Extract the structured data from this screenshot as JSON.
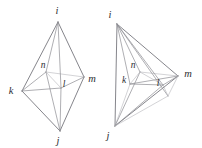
{
  "figure": {
    "kind": "geometry-line-drawing",
    "ink_color": "#8d8d92",
    "label_color": "#2d2d31",
    "background_color": "#ffffff",
    "panels": [
      {
        "id": "left",
        "name": "left-tetrahedron",
        "view": "front",
        "vertices": [
          {
            "label": "i",
            "x": 58,
            "y": 22,
            "label_x": 57,
            "label_y": 14
          },
          {
            "label": "j",
            "x": 60,
            "y": 131,
            "label_x": 58,
            "label_y": 144
          },
          {
            "label": "k",
            "x": 22,
            "y": 91,
            "label_x": 11,
            "label_y": 94
          },
          {
            "label": "m",
            "x": 84,
            "y": 77,
            "label_x": 90,
            "label_y": 82
          },
          {
            "label": "n",
            "x": 46,
            "y": 72,
            "label_x": 43,
            "label_y": 68
          },
          {
            "label": "l",
            "x": 61,
            "y": 88,
            "label_x": 63,
            "label_y": 87
          }
        ]
      },
      {
        "id": "right",
        "name": "right-tetrahedron",
        "view": "rotated",
        "vertices": [
          {
            "label": "i",
            "x": 117,
            "y": 24,
            "label_x": 110,
            "label_y": 18
          },
          {
            "label": "j",
            "x": 115,
            "y": 126,
            "label_x": 108,
            "label_y": 139
          },
          {
            "label": "k",
            "x": 130,
            "y": 84,
            "label_x": 124,
            "label_y": 83
          },
          {
            "label": "m",
            "x": 178,
            "y": 76,
            "label_x": 184,
            "label_y": 76
          },
          {
            "label": "n",
            "x": 140,
            "y": 72,
            "label_x": 132,
            "label_y": 68
          },
          {
            "label": "l",
            "x": 163,
            "y": 85,
            "label_x": 157,
            "label_y": 85
          }
        ]
      }
    ]
  }
}
